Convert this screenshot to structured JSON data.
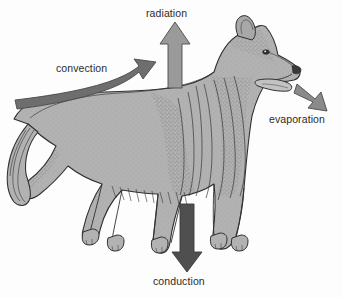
{
  "figure": {
    "background_color": "#fdfdfd",
    "width": 343,
    "height": 298
  },
  "labels": {
    "radiation": "radiation",
    "convection": "convection",
    "evaporation": "evaporation",
    "conduction": "conduction"
  },
  "arrows": [
    {
      "id": "radiation",
      "label": "radiation",
      "direction": "up",
      "color": "#9a9a9a",
      "outline": "#4a4a4a"
    },
    {
      "id": "convection",
      "label": "convection",
      "direction": "curved-up-right",
      "color": "#6e6e6e",
      "outline": "#4a4a4a"
    },
    {
      "id": "evaporation",
      "label": "evaporation",
      "direction": "down-right",
      "color": "#8a8a8a",
      "outline": "#4a4a4a"
    },
    {
      "id": "conduction",
      "label": "conduction",
      "direction": "down",
      "color": "#4f4f4f",
      "outline": "#3a3a3a"
    }
  ],
  "illustration": {
    "animal": "dog",
    "breed": "collie",
    "fill_color": "#b0b0b0",
    "line_color": "#2f2f2f",
    "features": [
      "pricked ears",
      "long muzzle",
      "protruding tongue",
      "thick mane ruff",
      "feathered tail",
      "four legs"
    ]
  }
}
